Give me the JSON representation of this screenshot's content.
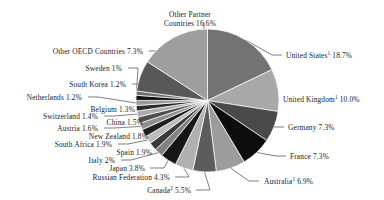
{
  "chart_data": {
    "type": "pie",
    "title": "",
    "subtitle": "",
    "xlabel": "",
    "ylabel": "",
    "legend_position": "callout-labels",
    "grid": false,
    "start_angle_deg": 0,
    "direction": "clockwise",
    "unit": "%",
    "categories": [
      "United States",
      "United Kingdom",
      "Germany",
      "France",
      "Australia",
      "Canada",
      "Russian Federation",
      "Japan",
      "Italy",
      "Spain",
      "South Africa",
      "New Zealand",
      "Austria",
      "China",
      "Switzerland",
      "Belgium",
      "Netherlands",
      "South Korea",
      "Sweden",
      "Other OECD Countries",
      "Other Partner Countries"
    ],
    "values": [
      18.7,
      10.0,
      7.3,
      7.3,
      6.9,
      5.5,
      4.3,
      3.8,
      2.0,
      1.9,
      1.9,
      1.8,
      1.6,
      1.5,
      1.4,
      1.3,
      1.2,
      1.2,
      1.0,
      7.3,
      16.6
    ],
    "slices": [
      {
        "name": "United States",
        "label": "United States",
        "sup": "1",
        "value": 18.7,
        "value_text": "18.7%",
        "color": "#737373",
        "side": "right"
      },
      {
        "name": "United Kingdom",
        "label": "United Kingdom",
        "sup": "1",
        "value": 10.0,
        "value_text": "10.0%",
        "color": "#a8a8a8",
        "side": "right"
      },
      {
        "name": "Germany",
        "label": "Germany",
        "sup": "",
        "value": 7.3,
        "value_text": "7.3%",
        "color": "#4a4a4a",
        "side": "right"
      },
      {
        "name": "France",
        "label": "France",
        "sup": "",
        "value": 7.3,
        "value_text": "7.3%",
        "color": "#0d0d0d",
        "side": "right"
      },
      {
        "name": "Australia",
        "label": "Australia",
        "sup": "1",
        "value": 6.9,
        "value_text": "6.9%",
        "color": "#9c9c9c",
        "side": "right"
      },
      {
        "name": "Canada",
        "label": "Canada",
        "sup": "2",
        "value": 5.5,
        "value_text": "5.5%",
        "color": "#5c5c5c",
        "side": "bottom"
      },
      {
        "name": "Russian Federation",
        "label": "Russian Federation",
        "sup": "",
        "value": 4.3,
        "value_text": "4.3%",
        "color": "#b0b0b0",
        "side": "bottom"
      },
      {
        "name": "Japan",
        "label": "Japan",
        "sup": "",
        "value": 3.8,
        "value_text": "3.8%",
        "color": "#161616",
        "side": "left"
      },
      {
        "name": "Italy",
        "label": "Italy",
        "sup": "",
        "value": 2.0,
        "value_text": "2%",
        "color": "#828282",
        "side": "left"
      },
      {
        "name": "Spain",
        "label": "Spain",
        "sup": "",
        "value": 1.9,
        "value_text": "1.9%",
        "color": "#3a3a3a",
        "side": "left"
      },
      {
        "name": "South Africa",
        "label": "South Africa",
        "sup": "",
        "value": 1.9,
        "value_text": "1.9%",
        "color": "#bdbdbd",
        "side": "left"
      },
      {
        "name": "New Zealand",
        "label": "New Zealand",
        "sup": "",
        "value": 1.8,
        "value_text": "1.8%",
        "color": "#1f1f1f",
        "side": "left"
      },
      {
        "name": "Austria",
        "label": "Austria",
        "sup": "",
        "value": 1.6,
        "value_text": "1.6%",
        "color": "#8e8e8e",
        "side": "left"
      },
      {
        "name": "China",
        "label": "China",
        "sup": "",
        "value": 1.5,
        "value_text": "1.5%",
        "color": "#4f4f4f",
        "side": "left"
      },
      {
        "name": "Switzerland",
        "label": "Switzerland",
        "sup": "",
        "value": 1.4,
        "value_text": "1.4%",
        "color": "#ababab",
        "side": "left"
      },
      {
        "name": "Belgium",
        "label": "Belgium",
        "sup": "",
        "value": 1.3,
        "value_text": "1.3%",
        "color": "#2b2b2b",
        "side": "left"
      },
      {
        "name": "Netherlands",
        "label": "Netherlands",
        "sup": "",
        "value": 1.2,
        "value_text": "1.2%",
        "color": "#9a9a9a",
        "side": "left"
      },
      {
        "name": "South Korea",
        "label": "South Korea",
        "sup": "",
        "value": 1.2,
        "value_text": "1.2%",
        "color": "#111111",
        "side": "left"
      },
      {
        "name": "Sweden",
        "label": "Sweden",
        "sup": "",
        "value": 1.0,
        "value_text": "1%",
        "color": "#6e6e6e",
        "side": "left"
      },
      {
        "name": "Other OECD Countries",
        "label": "Other OECD Countries",
        "sup": "",
        "value": 7.3,
        "value_text": "7.3%",
        "color": "#585858",
        "side": "top-left"
      },
      {
        "name": "Other Partner Countries",
        "label": "Other Partner Countries",
        "sup": "",
        "value": 16.6,
        "value_text": "16.6%",
        "color": "#9e9e9e",
        "side": "top-left"
      }
    ]
  },
  "labels": {
    "united_states": {
      "name": "United States",
      "sup": "1",
      "pct": "18.7%"
    },
    "united_kingdom": {
      "name": "United Kingdom",
      "sup": "1",
      "pct": "10.0%"
    },
    "germany": {
      "name": "Germany",
      "sup": "",
      "pct": "7.3%"
    },
    "france": {
      "name": "France",
      "sup": "",
      "pct": "7.3%"
    },
    "australia": {
      "name": "Australia",
      "sup": "1",
      "pct": "6.9%"
    },
    "canada": {
      "name": "Canada",
      "sup": "2",
      "pct": "5.5%"
    },
    "russian": {
      "name": "Russian Federation",
      "sup": "",
      "pct": "4.3%"
    },
    "japan": {
      "name": "Japan",
      "sup": "",
      "pct": "3.8%"
    },
    "italy": {
      "name": "Italy",
      "sup": "",
      "pct": "2%"
    },
    "spain": {
      "name": "Spain",
      "sup": "",
      "pct": "1.9%"
    },
    "south_africa": {
      "name": "South Africa",
      "sup": "",
      "pct": "1.9%"
    },
    "new_zealand": {
      "name": "New Zealand",
      "sup": "",
      "pct": "1.8%"
    },
    "austria": {
      "name": "Austria",
      "sup": "",
      "pct": "1.6%"
    },
    "china": {
      "name": "China",
      "sup": "",
      "pct": "1.5%"
    },
    "switzerland": {
      "name": "Switzerland",
      "sup": "",
      "pct": "1.4%"
    },
    "belgium": {
      "name": "Belgium",
      "sup": "",
      "pct": "1.3%"
    },
    "netherlands": {
      "name": "Netherlands",
      "sup": "",
      "pct": "1.2%"
    },
    "south_korea": {
      "name": "South Korea",
      "sup": "",
      "pct": "1.2%"
    },
    "sweden": {
      "name": "Sweden",
      "sup": "",
      "pct": "1%"
    },
    "other_oecd": {
      "name": "Other OECD Countries",
      "sup": "",
      "pct": "7.3%"
    },
    "other_partner": {
      "name": "Other Partner Countries",
      "sup": "",
      "pct": "16.6%"
    }
  }
}
